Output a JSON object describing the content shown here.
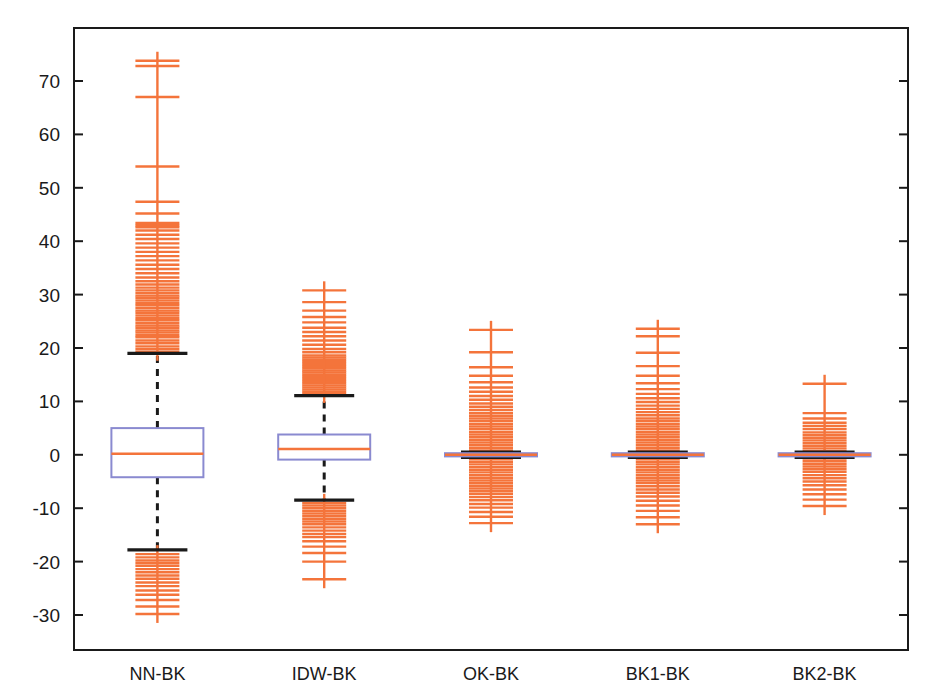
{
  "chart_data": {
    "type": "box",
    "title": "",
    "xlabel": "",
    "ylabel": "",
    "categories": [
      "NN-BK",
      "IDW-BK",
      "OK-BK",
      "BK1-BK",
      "BK2-BK"
    ],
    "yticks": [
      70,
      60,
      50,
      40,
      30,
      20,
      10,
      0,
      -10,
      -20,
      -30
    ],
    "ytick_labels": [
      "70",
      "60",
      "50",
      "40",
      "30",
      "20",
      "10",
      "0",
      "-10",
      "-20",
      "-30"
    ],
    "ylim": [
      -32,
      76
    ],
    "grid": false,
    "legend": false,
    "colors": {
      "box_edge": "#8a8ad0",
      "median": "#f4743b",
      "whisker": "#1a1a1a",
      "cap": "#1a1a1a",
      "outlier": "#f4743b",
      "axis": "#1a1a1a",
      "background": "#ffffff"
    },
    "boxes": [
      {
        "name": "NN-BK",
        "q1": -4.2,
        "median": 0.2,
        "q3": 5.0,
        "whisker_low": -17.8,
        "whisker_high": 19.0,
        "outliers_high": [
          19.3,
          19.8,
          20.3,
          20.9,
          21.4,
          22.0,
          22.4,
          22.9,
          23.3,
          23.8,
          24.2,
          24.7,
          25.2,
          25.6,
          26.1,
          26.6,
          27.0,
          27.5,
          28.0,
          28.4,
          28.9,
          29.4,
          29.8,
          30.3,
          30.8,
          31.3,
          31.9,
          32.5,
          33.2,
          34.0,
          34.8,
          35.6,
          36.4,
          37.2,
          38.0,
          38.8,
          39.6,
          40.4,
          41.2,
          42.0,
          42.6,
          43.0,
          43.4,
          45.2,
          47.4,
          54.0,
          67.0,
          72.8,
          73.8
        ],
        "outliers_low": [
          -18.6,
          -19.2,
          -19.8,
          -20.3,
          -20.8,
          -21.4,
          -22.0,
          -22.6,
          -23.2,
          -23.9,
          -24.6,
          -25.4,
          -26.2,
          -27.2,
          -28.4,
          -29.8
        ]
      },
      {
        "name": "IDW-BK",
        "q1": -0.9,
        "median": 1.1,
        "q3": 3.8,
        "whisker_low": -8.5,
        "whisker_high": 11.1,
        "outliers_high": [
          11.4,
          11.8,
          12.2,
          12.6,
          13.0,
          13.4,
          13.8,
          14.2,
          14.6,
          15.0,
          15.4,
          15.8,
          16.2,
          16.6,
          17.0,
          17.4,
          17.8,
          18.2,
          18.6,
          19.2,
          19.8,
          20.6,
          21.4,
          22.2,
          23.0,
          23.8,
          24.8,
          25.8,
          27.0,
          28.6,
          30.8
        ],
        "outliers_low": [
          -9.0,
          -9.5,
          -10.0,
          -10.5,
          -11.0,
          -11.5,
          -12.0,
          -12.5,
          -13.0,
          -13.6,
          -14.2,
          -14.8,
          -15.4,
          -16.2,
          -17.2,
          -18.4,
          -20.0,
          -23.3
        ]
      },
      {
        "name": "OK-BK",
        "q1": -0.3,
        "median": 0.0,
        "q3": 0.3,
        "whisker_low": -0.5,
        "whisker_high": 0.5,
        "outliers_high": [
          0.8,
          1.3,
          1.8,
          2.3,
          2.8,
          3.3,
          3.8,
          4.3,
          4.8,
          5.3,
          5.8,
          6.3,
          6.8,
          7.3,
          7.8,
          8.4,
          9.0,
          9.6,
          10.3,
          11.0,
          11.8,
          12.6,
          13.6,
          14.8,
          16.4,
          19.2,
          23.4
        ],
        "outliers_low": [
          -0.8,
          -1.3,
          -1.8,
          -2.3,
          -2.8,
          -3.3,
          -3.8,
          -4.3,
          -4.8,
          -5.3,
          -5.8,
          -6.3,
          -6.8,
          -7.3,
          -7.9,
          -8.5,
          -9.2,
          -9.9,
          -10.7,
          -11.6,
          -12.8
        ]
      },
      {
        "name": "BK1-BK",
        "q1": -0.3,
        "median": 0.0,
        "q3": 0.3,
        "whisker_low": -0.5,
        "whisker_high": 0.5,
        "outliers_high": [
          0.8,
          1.3,
          1.8,
          2.3,
          2.8,
          3.3,
          3.8,
          4.3,
          4.8,
          5.3,
          5.8,
          6.3,
          6.8,
          7.4,
          8.0,
          8.6,
          9.2,
          9.9,
          10.6,
          11.4,
          12.3,
          13.4,
          14.8,
          16.6,
          19.1,
          22.2,
          23.6
        ],
        "outliers_low": [
          -0.8,
          -1.3,
          -1.8,
          -2.3,
          -2.8,
          -3.3,
          -3.8,
          -4.3,
          -4.8,
          -5.3,
          -5.9,
          -6.5,
          -7.1,
          -7.8,
          -8.6,
          -9.5,
          -10.5,
          -11.7,
          -13.0
        ]
      },
      {
        "name": "BK2-BK",
        "q1": -0.3,
        "median": 0.0,
        "q3": 0.3,
        "whisker_low": -0.5,
        "whisker_high": 0.5,
        "outliers_high": [
          0.7,
          1.2,
          1.7,
          2.2,
          2.7,
          3.2,
          3.7,
          4.2,
          4.8,
          5.4,
          6.0,
          6.8,
          7.8,
          13.3
        ],
        "outliers_low": [
          -0.7,
          -1.2,
          -1.7,
          -2.2,
          -2.7,
          -3.2,
          -3.8,
          -4.4,
          -5.0,
          -5.7,
          -6.5,
          -7.4,
          -8.4,
          -9.6
        ]
      }
    ]
  }
}
